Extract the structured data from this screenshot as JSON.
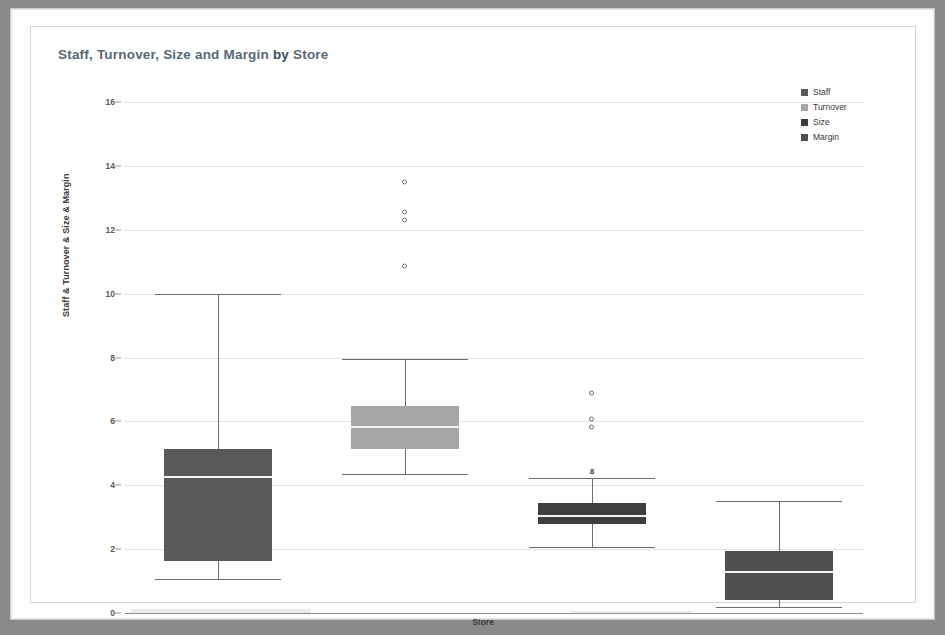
{
  "chart_data": {
    "type": "box",
    "title": "Staff, Turnover, Size and Margin by Store",
    "title_parts": {
      "lead": "Staff, Turnover, Size and Margin",
      "by": "by",
      "trail": "Store"
    },
    "xlabel": "Store",
    "ylabel": "Staff & Turnover & Size & Margin",
    "ylim": [
      0,
      16
    ],
    "yticks": [
      0,
      2,
      4,
      6,
      8,
      10,
      12,
      14,
      16
    ],
    "ytick_labels": [
      "0",
      "2",
      "4",
      "6",
      "8",
      "10",
      "12",
      "14",
      "16"
    ],
    "grid": true,
    "grid_axis": "y",
    "legend_position": "top-right",
    "categories": [
      "Staff",
      "Turnover",
      "Size",
      "Margin"
    ],
    "series": [
      {
        "name": "Staff",
        "color": "#595959",
        "whisker_high": 10.0,
        "q3": 5.13,
        "median": 4.26,
        "q1": 1.63,
        "whisker_low": 1.05,
        "outliers": [],
        "labels": []
      },
      {
        "name": "Turnover",
        "color": "#a6a6a6",
        "whisker_high": 7.95,
        "q3": 6.48,
        "median": 5.82,
        "q1": 5.13,
        "whisker_low": 4.35,
        "outliers": [
          13.5,
          12.55,
          12.3,
          10.85
        ],
        "labels": []
      },
      {
        "name": "Size",
        "color": "#3f3f3f",
        "whisker_high": 4.23,
        "q3": 3.45,
        "median": 3.04,
        "q1": 2.79,
        "whisker_low": 2.07,
        "outliers": [
          6.88,
          6.07,
          5.82
        ],
        "labels": [
          {
            "text": "8",
            "value": 4.23
          }
        ]
      },
      {
        "name": "Margin",
        "color": "#4f4f4f",
        "whisker_high": 3.52,
        "q3": 1.93,
        "median": 1.28,
        "q1": 0.42,
        "whisker_low": 0.18,
        "outliers": [],
        "labels": []
      }
    ]
  },
  "legend": {
    "items": [
      {
        "label": "Staff",
        "color": "#595959"
      },
      {
        "label": "Turnover",
        "color": "#a6a6a6"
      },
      {
        "label": "Size",
        "color": "#3f3f3f"
      },
      {
        "label": "Margin",
        "color": "#4f4f4f"
      }
    ]
  },
  "colors": {
    "title": "#4a5b6b",
    "grid": "#e4e4e4",
    "axis": "#8d8d8d",
    "plot_background": "#ffffff",
    "page_background": "#fdfdfd",
    "outer_background": "#8a8a8a"
  }
}
